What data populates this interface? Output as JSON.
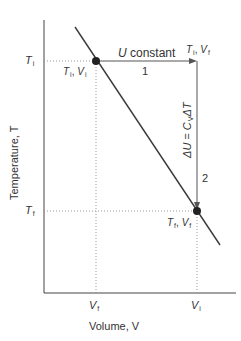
{
  "axes": {
    "y_title": "Temperature, T",
    "x_title": "Volume, V",
    "y_ticks": [
      {
        "var": "T",
        "sub": "i"
      },
      {
        "var": "T",
        "sub": "f"
      }
    ],
    "x_ticks": [
      {
        "var": "V",
        "sub": "f"
      },
      {
        "var": "V",
        "sub": "i"
      }
    ]
  },
  "points": {
    "start": {
      "label_T": "T",
      "label_T_sub": "i",
      "label_sep": ", ",
      "label_V": "V",
      "label_V_sub": "i"
    },
    "corner": {
      "label_T": "T",
      "label_T_sub": "i",
      "label_sep": ", ",
      "label_V": "V",
      "label_V_sub": "f"
    },
    "end": {
      "label_T": "T",
      "label_T_sub": "f",
      "label_sep": ", ",
      "label_V": "V",
      "label_V_sub": "f"
    }
  },
  "steps": {
    "step1_label": "U",
    "step1_text": " constant",
    "step1_number": "1",
    "step2_equation_lhs": "ΔU",
    "step2_equation_eq": " = ",
    "step2_equation_c": "C",
    "step2_equation_csub": "V",
    "step2_equation_rhs": "ΔT",
    "step2_number": "2"
  },
  "colors": {
    "line": "#3a3a3a",
    "axis": "#444444",
    "dotted": "#999999",
    "point": "#222222"
  }
}
